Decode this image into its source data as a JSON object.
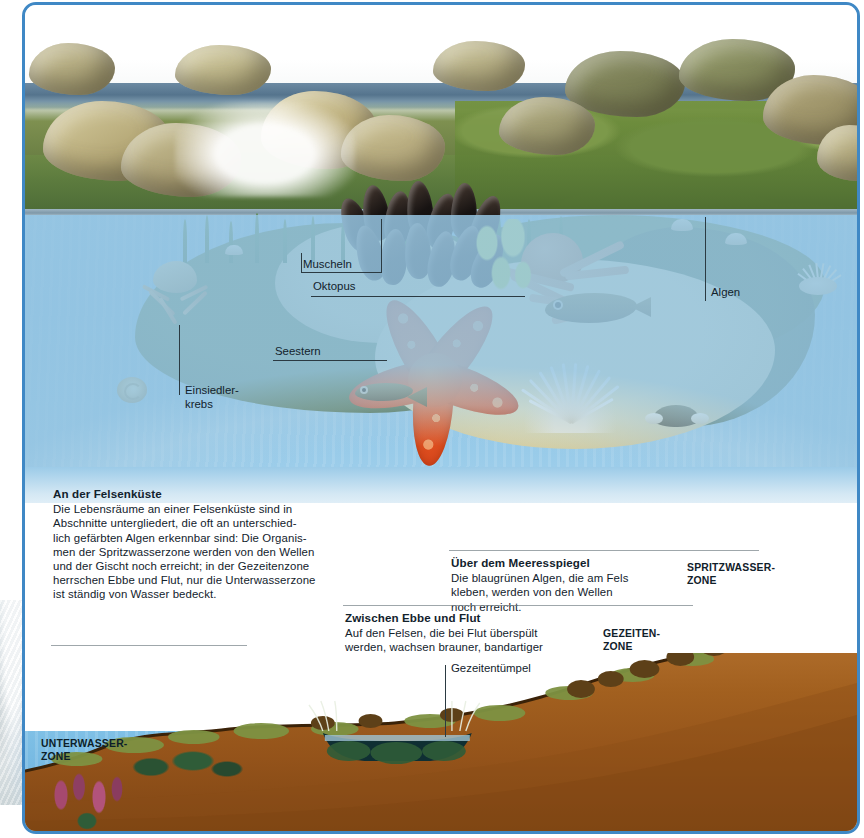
{
  "figure": {
    "title_internal": "An der Felsenküste",
    "accent_frame_color": "#3f88c5",
    "water_color": "#8cc2e4",
    "earth_color": "#9a5f26"
  },
  "callouts": [
    {
      "id": "muscheln",
      "label": "Muscheln"
    },
    {
      "id": "oktopus",
      "label": "Oktopus"
    },
    {
      "id": "seestern",
      "label": "Seestern"
    },
    {
      "id": "einsiedlerkrebs",
      "label": "Einsiedler-\nkrebs",
      "line1": "Einsiedler-",
      "line2": "krebs"
    },
    {
      "id": "algen",
      "label": "Algen"
    },
    {
      "id": "gezeitentuempel",
      "label": "Gezeitentümpel"
    }
  ],
  "text_blocks": [
    {
      "id": "an-der-felsenkueste",
      "heading": "An der Felsenküste",
      "body": "Die Lebensräume an einer Felsenküste sind in Abschnitte untergliedert, die oft an unterschiedlich gefärbten Algen erkennbar sind: Die Organismen der Spritzwasserzone werden von den Wellen und der Gischt noch erreicht; in der Gezeitenzone herrschen Ebbe und Flut, nur die Unterwasserzone ist ständig von Wasser bedeckt.",
      "lines": [
        "Die Lebensräume an einer Felsenküste sind in",
        "Abschnitte untergliedert, die oft an unterschied-",
        "lich gefärbten Algen erkennbar sind: Die Organis-",
        "men der Spritzwasserzone werden von den Wellen",
        "und der Gischt noch erreicht; in der Gezeitenzone",
        "herrschen Ebbe und Flut, nur die Unterwasserzone",
        "ist ständig von Wasser bedeckt."
      ]
    },
    {
      "id": "ueber-dem-meeresspiegel",
      "heading": "Über dem Meeresspiegel",
      "body": "Die blaugrünen Algen, die am Fels kleben, werden von den Wellen noch erreicht.",
      "lines": [
        "Die blaugrünen Algen, die am Fels",
        "kleben, werden von den Wellen",
        "noch erreicht."
      ]
    },
    {
      "id": "zwischen-ebbe-und-flut",
      "heading": "Zwischen Ebbe und Flut",
      "body": "Auf den Felsen, die bei Flut überspült werden, wachsen brauner, bandartiger Blasentang und leuchtend grüne Algen.",
      "lines": [
        "Auf den Felsen, die bei Flut überspült",
        "werden, wachsen brauner, bandartiger",
        "Blasentang und leuchtend grüne Algen."
      ]
    },
    {
      "id": "unter-dem-meeresspiegel",
      "heading": "Unter dem Meeresspiegel",
      "body": "Hier wachsen rote Algen oder große braune Tange. Bis auf seltene, sehr tiefe Gezeiten sind sie ständig mit Wasser bedeckt.",
      "lines": [
        "Hier wachsen rote Algen oder",
        "große braune Tange. Bis auf",
        "seltene, sehr tiefe Gezeiten sind",
        "sie ständig mit Wasser bedeckt."
      ]
    }
  ],
  "zones": [
    {
      "id": "spritzwasserzone",
      "line1": "SPRITZWASSER-",
      "line2": "ZONE"
    },
    {
      "id": "gezeitenzone",
      "line1": "GEZEITEN-",
      "line2": "ZONE"
    },
    {
      "id": "unterwasserzone",
      "line1": "UNTERWASSER-",
      "line2": "ZONE"
    }
  ]
}
